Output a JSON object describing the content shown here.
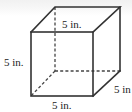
{
  "figure": {
    "shape": "cube",
    "labels": {
      "top": "5 in.",
      "left": "5 in.",
      "bottom": "5 in.",
      "right": "5 in"
    },
    "colors": {
      "edge": "#333333",
      "text": "#222222",
      "background": "#ffffff"
    }
  }
}
